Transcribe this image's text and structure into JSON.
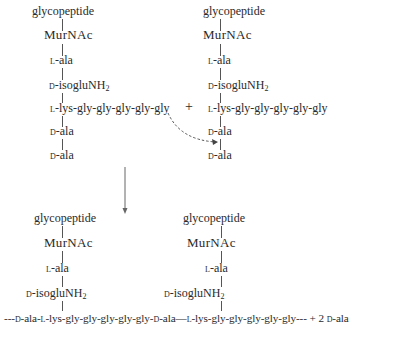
{
  "reactants": {
    "left": {
      "glycopeptide": "glycopeptide",
      "murnac": "MurNAc",
      "l_ala_prefix": "l",
      "l_ala": "-ala",
      "d_isoglu_prefix": "d",
      "d_isoglu": "-isogluNH",
      "d_isoglu_sub": "2",
      "lys_prefix": "l",
      "lys_chain": "-lys-gly-gly-gly-gly-gly",
      "d_ala1_prefix": "d",
      "d_ala1": "-ala",
      "d_ala2_prefix": "d",
      "d_ala2": "-ala"
    },
    "plus": "+",
    "right": {
      "glycopeptide": "glycopeptide",
      "murnac": "MurNAc",
      "l_ala_prefix": "l",
      "l_ala": "-ala",
      "d_isoglu_prefix": "d",
      "d_isoglu": "-isogluNH",
      "d_isoglu_sub": "2",
      "lys_prefix": "l",
      "lys_chain": "-lys-gly-gly-gly-gly-gly",
      "d_ala1_prefix": "d",
      "d_ala1": "-ala",
      "d_ala2_prefix": "d",
      "d_ala2": "-ala"
    }
  },
  "product": {
    "left": {
      "glycopeptide": "glycopeptide",
      "murnac": "MurNAc",
      "l_ala_prefix": "l",
      "l_ala": "-ala",
      "d_isoglu_prefix": "d",
      "d_isoglu": "-isogluNH",
      "d_isoglu_sub": "2"
    },
    "right": {
      "glycopeptide": "glycopeptide",
      "murnac": "MurNAc",
      "l_ala_prefix": "l",
      "l_ala": "-ala",
      "d_isoglu_prefix": "d",
      "d_isoglu": "-isogluNH",
      "d_isoglu_sub": "2"
    },
    "chain": {
      "lead": "---",
      "p1": "d",
      "s1": "-ala-",
      "p2": "l",
      "s2": "-lys-gly-gly-gly-gly-gly-",
      "p3": "d",
      "s3": "-ala—",
      "p4": "l",
      "s4": "-lys-gly-gly-gly-gly-gly---",
      "byproduct": "+ 2 ",
      "byproduct_prefix": "d",
      "byproduct_suffix": "-ala"
    }
  },
  "arrows": {
    "reaction_arrow": "down",
    "transpeptidation_arrow": "dashed-curved"
  }
}
